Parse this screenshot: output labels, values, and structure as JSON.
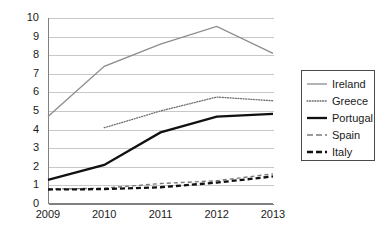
{
  "chart_data": {
    "type": "line",
    "title": "",
    "subtitle": "",
    "xlabel": "",
    "ylabel": "",
    "categories": [
      "2009",
      "2010",
      "2011",
      "2012",
      "2013"
    ],
    "x": [
      2009,
      2010,
      2011,
      2012,
      2013
    ],
    "xlim": [
      2009,
      2013
    ],
    "ylim": [
      0,
      10
    ],
    "yticks": [
      0,
      1,
      2,
      3,
      4,
      5,
      6,
      7,
      8,
      9,
      10
    ],
    "ytick_labels": [
      "0",
      "1",
      "2",
      "3",
      "4",
      "5",
      "6",
      "7",
      "8",
      "9",
      "10"
    ],
    "grid": "horizontal",
    "legend_position": "right",
    "series": [
      {
        "name": "Ireland",
        "values": [
          4.7,
          7.4,
          8.6,
          9.55,
          8.1
        ],
        "color": "#8c8c8c",
        "style": "solid",
        "width": 1.3
      },
      {
        "name": "Greece",
        "values": [
          null,
          4.1,
          5.0,
          5.75,
          5.55
        ],
        "color": "#6e6e6e",
        "style": "dotted",
        "width": 1.3
      },
      {
        "name": "Portugal",
        "values": [
          1.3,
          2.1,
          3.85,
          4.7,
          4.85
        ],
        "color": "#111111",
        "style": "solid",
        "width": 2.3
      },
      {
        "name": "Spain",
        "values": [
          0.8,
          0.85,
          1.1,
          1.25,
          1.62
        ],
        "color": "#7a7a7a",
        "style": "dashed",
        "width": 1.4
      },
      {
        "name": "Italy",
        "values": [
          0.78,
          0.8,
          0.9,
          1.15,
          1.48
        ],
        "color": "#111111",
        "style": "dashed",
        "width": 2.3
      }
    ]
  },
  "legend": {
    "items": [
      {
        "label": "Ireland"
      },
      {
        "label": "Greece"
      },
      {
        "label": "Portugal"
      },
      {
        "label": "Spain"
      },
      {
        "label": "Italy"
      }
    ]
  },
  "axes": {
    "y_labels": [
      "10",
      "9",
      "8",
      "7",
      "6",
      "5",
      "4",
      "3",
      "2",
      "1",
      "0"
    ],
    "x_labels": [
      "2009",
      "2010",
      "2011",
      "2012",
      "2013"
    ]
  },
  "colors": {
    "gridline": "#c8c8c8",
    "axis": "#808080",
    "text": "#1a1a1a",
    "legend_border": "#4a4a4a",
    "background": "#ffffff"
  }
}
